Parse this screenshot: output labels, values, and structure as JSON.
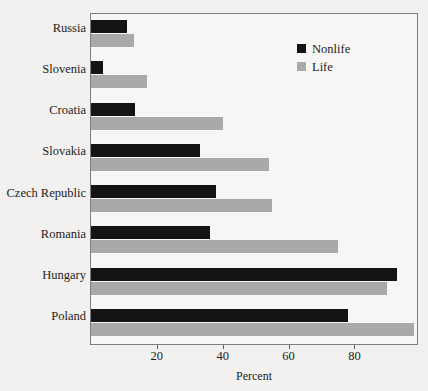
{
  "chart_data": {
    "type": "bar",
    "orientation": "horizontal",
    "title": "",
    "xlabel": "Percent",
    "ylabel": "",
    "xlim": [
      0,
      99
    ],
    "xticks": [
      20,
      40,
      60,
      80
    ],
    "grid": false,
    "legend_position": "top-right",
    "categories": [
      "Russia",
      "Slovenia",
      "Croatia",
      "Slovakia",
      "Czech Republic",
      "Romania",
      "Hungary",
      "Poland"
    ],
    "series": [
      {
        "name": "Nonlife",
        "color": "#141414",
        "values": [
          11,
          3.5,
          13.5,
          33,
          38,
          36,
          93,
          78
        ]
      },
      {
        "name": "Life",
        "color": "#a9a9a9",
        "values": [
          13,
          17,
          40,
          54,
          55,
          75,
          90,
          98
        ]
      }
    ]
  },
  "axis": {
    "x_title": "Percent",
    "tick_labels": [
      "20",
      "40",
      "60",
      "80"
    ]
  },
  "legend": {
    "items": [
      {
        "label": "Nonlife",
        "color": "#141414"
      },
      {
        "label": "Life",
        "color": "#a9a9a9"
      }
    ]
  }
}
